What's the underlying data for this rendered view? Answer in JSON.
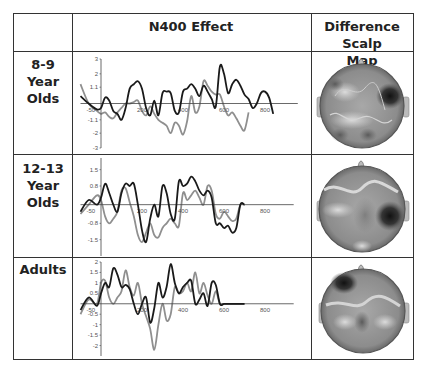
{
  "table": {
    "headers": [
      "",
      "N400 Effect",
      "Difference Scalp Map"
    ],
    "header_lines": {
      "col2": "N400 Effect",
      "col3_line1": "Difference Scalp",
      "col3_line2": "Map"
    },
    "rows": [
      {
        "label_lines": [
          "8-9 Year",
          "Olds"
        ]
      },
      {
        "label_lines": [
          "12-13",
          "Year",
          "Olds"
        ]
      },
      {
        "label_lines": [
          "Adults"
        ]
      }
    ]
  },
  "colors": {
    "series_dark": "#1a1a1a",
    "series_light": "#8f8f8f",
    "axis": "#444444",
    "border": "#333333"
  },
  "chart_data": [
    {
      "type": "line",
      "title": "N400 Effect - 8-9 Year Olds",
      "xlabel": "",
      "ylabel": "",
      "x_tick_labels": [
        "-50",
        "200",
        "400",
        "600",
        "800"
      ],
      "y_tick_labels": [
        "3",
        "2",
        "1.1",
        "-1.1",
        "-2",
        "-3"
      ],
      "ylim": [
        -3,
        3
      ],
      "xlim": [
        -100,
        960
      ],
      "grid": false,
      "x": [
        -100,
        -60,
        -20,
        0,
        20,
        40,
        60,
        80,
        100,
        120,
        140,
        160,
        180,
        200,
        220,
        240,
        260,
        280,
        300,
        320,
        340,
        360,
        380,
        400,
        420,
        440,
        460,
        480,
        500,
        520,
        540,
        560,
        580,
        600,
        620,
        640,
        660,
        680,
        700,
        720,
        740,
        760,
        780,
        800,
        820,
        840,
        860,
        880,
        900,
        920,
        940,
        960
      ],
      "series": [
        {
          "name": "dark",
          "values": [
            0.5,
            0.0,
            -0.4,
            -0.3,
            0.4,
            0.2,
            -0.5,
            -0.7,
            -1.1,
            -0.3,
            1.0,
            1.3,
            1.5,
            1.0,
            -0.3,
            -0.8,
            0.2,
            -0.8,
            0.7,
            0.8,
            0.7,
            -0.5,
            -0.6,
            0.8,
            1.0,
            1.3,
            1.0,
            0.5,
            1.2,
            0.8,
            0.3,
            -0.2,
            2.5,
            2.0,
            0.7,
            1.3,
            1.6,
            1.2,
            0.6,
            0.3,
            -0.3,
            0.0,
            0.7,
            0.8,
            0.4,
            -0.7,
            0.0,
            0.0,
            0.0,
            0.0,
            0.0,
            0.0
          ]
        },
        {
          "name": "light",
          "values": [
            1.3,
            0.0,
            -0.5,
            -0.7,
            -0.6,
            -0.9,
            -1.0,
            -0.6,
            -0.3,
            0.0,
            0.0,
            0.1,
            0.2,
            -0.5,
            -0.8,
            -0.2,
            -0.7,
            -1.1,
            -1.3,
            -1.5,
            -2.0,
            -1.3,
            -1.5,
            -2.1,
            -1.2,
            0.5,
            -0.6,
            -0.2,
            1.5,
            1.2,
            0.8,
            0.6,
            0.6,
            -0.2,
            -0.8,
            -0.6,
            -1.0,
            -1.5,
            -1.8,
            -0.6,
            0.0,
            0.0,
            0.0,
            0.0,
            0.0,
            0.0,
            0.0,
            0.0,
            0.0,
            0.0,
            0.0,
            0.0
          ]
        }
      ]
    },
    {
      "type": "line",
      "title": "N400 Effect - 12-13 Year Olds",
      "xlabel": "",
      "ylabel": "",
      "x_tick_labels": [
        "-50",
        "200",
        "400",
        "600",
        "800"
      ],
      "y_tick_labels": [
        "1.5",
        "0.8",
        "-0.8",
        "-1.5"
      ],
      "ylim": [
        -2.2,
        2.0
      ],
      "xlim": [
        -100,
        960
      ],
      "grid": false,
      "x": [
        -100,
        -60,
        -20,
        0,
        20,
        40,
        60,
        80,
        100,
        120,
        140,
        160,
        180,
        200,
        220,
        240,
        260,
        280,
        300,
        320,
        340,
        360,
        380,
        400,
        420,
        440,
        460,
        480,
        500,
        520,
        540,
        560,
        580,
        600,
        620,
        640,
        660,
        680,
        700,
        720,
        740,
        760,
        780,
        800,
        820,
        840,
        860,
        880,
        900,
        920,
        940
      ],
      "series": [
        {
          "name": "dark",
          "values": [
            -0.3,
            0.2,
            0.0,
            0.3,
            0.9,
            0.5,
            0.0,
            -0.3,
            0.5,
            0.9,
            0.8,
            0.9,
            0.0,
            -1.1,
            -1.6,
            -0.6,
            0.0,
            -0.5,
            0.8,
            0.5,
            -0.4,
            -0.6,
            1.0,
            0.8,
            0.9,
            1.2,
            1.0,
            0.6,
            0.4,
            0.6,
            0.3,
            -0.8,
            -0.8,
            -1.0,
            -0.9,
            -1.2,
            -1.0,
            0,
            0,
            0,
            0,
            0,
            0,
            0,
            0,
            0,
            0,
            0,
            0,
            0,
            0
          ]
        },
        {
          "name": "light",
          "values": [
            -0.4,
            0.0,
            0.4,
            0.2,
            -0.5,
            -0.8,
            -0.6,
            -0.3,
            0.6,
            0.7,
            0.1,
            -0.5,
            -1.3,
            -1.6,
            -1.2,
            -0.8,
            -1.3,
            -1.4,
            -1.0,
            -0.8,
            -0.6,
            -0.8,
            -0.9,
            0.5,
            0.2,
            0.4,
            0.6,
            0.3,
            0.0,
            0.8,
            0.6,
            -0.4,
            -0.6,
            -0.3,
            -0.5,
            -0.7,
            -0.6,
            0,
            0,
            0,
            0,
            0,
            0,
            0,
            0,
            0,
            0,
            0,
            0,
            0,
            0
          ]
        }
      ]
    },
    {
      "type": "line",
      "title": "N400 Effect - Adults",
      "xlabel": "",
      "ylabel": "",
      "x_tick_labels": [
        "-50",
        "200",
        "400",
        "600",
        "800"
      ],
      "y_tick_labels": [
        "2",
        "1.5",
        "1",
        "0.5",
        "-0.5",
        "-1",
        "-1.5",
        "-2"
      ],
      "ylim": [
        -2.5,
        2.0
      ],
      "xlim": [
        -100,
        960
      ],
      "grid": false,
      "x": [
        -100,
        -60,
        -20,
        0,
        20,
        40,
        60,
        80,
        100,
        120,
        140,
        160,
        180,
        200,
        220,
        240,
        260,
        280,
        300,
        320,
        340,
        360,
        380,
        400,
        420,
        440,
        460,
        480,
        500,
        520,
        540,
        560,
        580,
        600,
        620,
        640,
        660,
        680,
        700,
        720,
        740,
        760,
        780,
        800,
        820,
        840,
        860,
        880,
        900,
        920,
        940
      ],
      "series": [
        {
          "name": "dark",
          "values": [
            -0.3,
            0.3,
            -0.1,
            0.5,
            1.0,
            0.8,
            1.7,
            1.4,
            0.8,
            0.9,
            0.7,
            0.0,
            -0.5,
            0.0,
            0.3,
            -0.9,
            -0.2,
            1.0,
            0.3,
            0.8,
            1.9,
            1.0,
            0.5,
            0.8,
            1.0,
            1.1,
            0.0,
            0.2,
            0.5,
            -0.1,
            1.0,
            0.9,
            0,
            0,
            0,
            0,
            0,
            0,
            0,
            0,
            0,
            0,
            0,
            0,
            0,
            0,
            0,
            0,
            0,
            0,
            0
          ]
        },
        {
          "name": "light",
          "values": [
            -0.5,
            0.2,
            0.0,
            1.0,
            1.1,
            0.3,
            0.0,
            0.3,
            0.6,
            1.6,
            0.8,
            0.4,
            1.0,
            0.0,
            -0.6,
            -1.2,
            -2.2,
            -1.0,
            0.0,
            -0.8,
            -0.5,
            0.8,
            0.5,
            0.6,
            1.0,
            0.6,
            1.5,
            0.5,
            1.0,
            0.4,
            0.0,
            0.6,
            0,
            0,
            0,
            0,
            0,
            0,
            0,
            0,
            0,
            0,
            0,
            0,
            0,
            0,
            0,
            0,
            0,
            0,
            0
          ]
        }
      ]
    }
  ],
  "scalp_maps": [
    {
      "row": "8-9 Year Olds",
      "dark_region": "right-frontal"
    },
    {
      "row": "12-13 Year Olds",
      "dark_region": "right-temporal"
    },
    {
      "row": "Adults",
      "dark_region": "left-frontal"
    }
  ]
}
